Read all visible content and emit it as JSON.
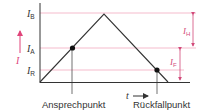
{
  "diagram": {
    "type": "relay switching characteristic",
    "y_axis": {
      "symbol": "I",
      "arrow_color": "#e0447a"
    },
    "x_axis": {
      "symbol": "t"
    },
    "levels": [
      {
        "id": "IB",
        "symbol": "I",
        "subscript": "B"
      },
      {
        "id": "IA",
        "symbol": "I",
        "subscript": "A"
      },
      {
        "id": "IR",
        "symbol": "I",
        "subscript": "R"
      }
    ],
    "dimensions": [
      {
        "id": "IH",
        "symbol": "I",
        "subscript": "H"
      },
      {
        "id": "IF",
        "symbol": "I",
        "subscript": "F"
      }
    ],
    "points": [
      {
        "id": "ansprech",
        "label": "Ansprechpunkt"
      },
      {
        "id": "rueckfall",
        "label": "Rückfallpunkt"
      }
    ],
    "colors": {
      "axis": "#333333",
      "curve": "#333333",
      "guide_lines": "#f2a9bf",
      "accent": "#e0447a",
      "dimension": "#d24a7a"
    }
  }
}
